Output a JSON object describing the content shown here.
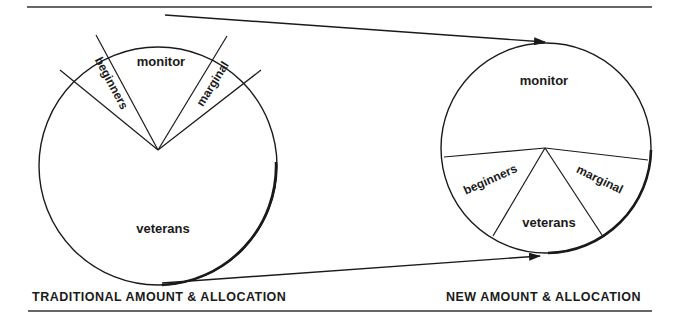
{
  "diagram": {
    "left_pie": {
      "caption": "TRADITIONAL AMOUNT & ALLOCATION",
      "slices": [
        {
          "label": "monitor"
        },
        {
          "label": "beginners"
        },
        {
          "label": "marginal"
        },
        {
          "label": "veterans"
        }
      ]
    },
    "right_pie": {
      "caption": "NEW AMOUNT & ALLOCATION",
      "slices": [
        {
          "label": "monitor"
        },
        {
          "label": "beginners"
        },
        {
          "label": "marginal"
        },
        {
          "label": "veterans"
        }
      ]
    },
    "colors": {
      "ink": "#1a1a1a",
      "background": "#ffffff"
    }
  }
}
